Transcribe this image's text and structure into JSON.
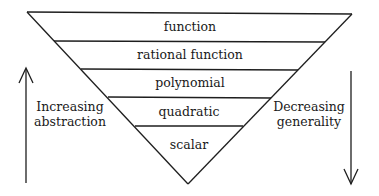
{
  "diagram": {
    "levels": [
      {
        "label": "function"
      },
      {
        "label": "rational function"
      },
      {
        "label": "polynomial"
      },
      {
        "label": "quadratic"
      },
      {
        "label": "scalar"
      }
    ],
    "left_annotation": {
      "line1": "Increasing",
      "line2": "abstraction",
      "arrow_direction": "up"
    },
    "right_annotation": {
      "line1": "Decreasing",
      "line2": "generality",
      "arrow_direction": "down"
    },
    "colors": {
      "stroke": "#1e1e1e",
      "text": "#1a1a1a",
      "background": "#ffffff"
    }
  }
}
